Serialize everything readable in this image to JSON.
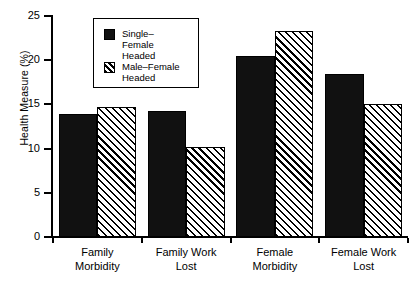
{
  "chart_data": {
    "type": "bar",
    "title": "",
    "xlabel": "",
    "ylabel": "Health Measure (%)",
    "ylim": [
      0,
      25
    ],
    "ytick_labels": [
      "0",
      "5",
      "10",
      "15",
      "20",
      "25"
    ],
    "yticks": [
      0,
      5,
      10,
      15,
      20,
      25
    ],
    "grid": false,
    "legend_position": "upper-left-inside",
    "categories": [
      "Family Morbidity",
      "Family Work Lost",
      "Female Morbidity",
      "Female Work Lost"
    ],
    "category_lines": [
      [
        "Family",
        "Morbidity"
      ],
      [
        "Family Work",
        "Lost"
      ],
      [
        "Female",
        "Morbidity"
      ],
      [
        "Female Work",
        "Lost"
      ]
    ],
    "series": [
      {
        "name": "Single-Female Headed",
        "name_lines": [
          "Single–",
          "Female",
          "Headed"
        ],
        "fill": "solid",
        "color": "#111111",
        "values": [
          13.9,
          14.3,
          20.5,
          18.4
        ]
      },
      {
        "name": "Male-Female Headed",
        "name_lines": [
          "Male–Female",
          "Headed"
        ],
        "fill": "hatch",
        "color": "#000000",
        "values": [
          14.7,
          10.2,
          23.3,
          15.0
        ]
      }
    ]
  }
}
